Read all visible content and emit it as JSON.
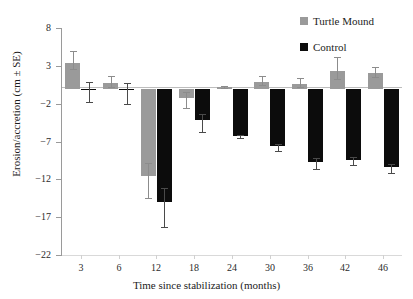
{
  "chart_data": {
    "type": "bar",
    "title": "",
    "xlabel": "Time since stabilization (months)",
    "ylabel": "Erosion/accretion (cm ± SE)",
    "categories": [
      "3",
      "6",
      "12",
      "18",
      "24",
      "30",
      "36",
      "42",
      "46"
    ],
    "ylim": [
      -22,
      8
    ],
    "yticks": [
      8,
      3,
      -2,
      -7,
      -12,
      -17,
      -22
    ],
    "ytick_labels": [
      "8",
      "3",
      "−2",
      "−7",
      "−12",
      "−17",
      "−22"
    ],
    "grid": false,
    "legend_position": "top-right",
    "error_bars": "SE",
    "series": [
      {
        "name": "Turtle Mound",
        "color": "#9a9a9a",
        "values": [
          3.4,
          0.7,
          -11.5,
          -1.2,
          0.2,
          0.9,
          0.6,
          2.3,
          2.0
        ],
        "errors": [
          1.5,
          0.9,
          3.0,
          1.4,
          0.2,
          0.8,
          0.8,
          1.9,
          0.8
        ]
      },
      {
        "name": "Control",
        "color": "#0c0c0c",
        "values": [
          -0.1,
          -0.2,
          -15.0,
          -4.2,
          -6.3,
          -7.6,
          -9.7,
          -9.4,
          -10.4
        ],
        "errors": [
          1.7,
          1.8,
          3.3,
          1.5,
          0.3,
          0.6,
          0.9,
          0.7,
          0.7
        ]
      }
    ]
  }
}
